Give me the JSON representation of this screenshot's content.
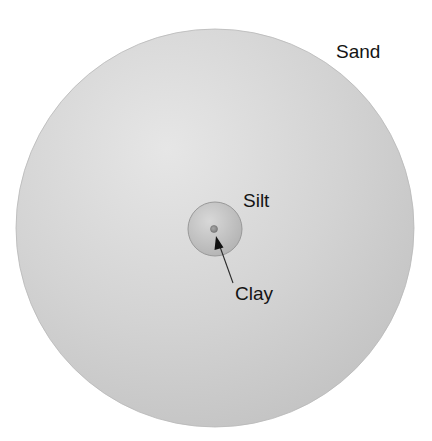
{
  "diagram": {
    "type": "relative-particle-size-comparison",
    "particles": [
      {
        "name": "Sand",
        "label": "Sand",
        "shape": "circle",
        "relative_size": "largest",
        "center": [
          215,
          228
        ],
        "radius": 199,
        "fill_light": "#e4e4e4",
        "fill_dark": "#c3c3c3"
      },
      {
        "name": "Silt",
        "label": "Silt",
        "shape": "circle",
        "relative_size": "medium",
        "center": [
          215,
          229
        ],
        "radius": 27,
        "fill_light": "#d6d6d6",
        "fill_dark": "#b3b3b3",
        "stroke": "#9a9a9a"
      },
      {
        "name": "Clay",
        "label": "Clay",
        "shape": "circle",
        "relative_size": "smallest",
        "center": [
          214,
          229
        ],
        "radius": 3.5,
        "fill": "#8f8f8f",
        "stroke": "#6e6e6e"
      }
    ],
    "annotations": [
      {
        "target": "Clay",
        "type": "arrow",
        "from": [
          233,
          283
        ],
        "to": [
          216,
          236
        ],
        "color": "#2a2a2a"
      }
    ],
    "colors": {
      "background": "#ffffff",
      "text": "#141414"
    }
  }
}
